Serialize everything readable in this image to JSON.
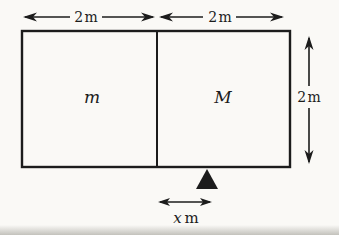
{
  "figure": {
    "dimension_labels": {
      "top_left": "2 m",
      "top_right": "2 m",
      "right": "2 m"
    },
    "mass_labels": {
      "left": "m",
      "right": "M"
    },
    "fulcrum_offset_label": {
      "value": "x",
      "unit": "m"
    },
    "colors": {
      "line": "#1c1c1c",
      "background": "#faf9f6"
    }
  }
}
